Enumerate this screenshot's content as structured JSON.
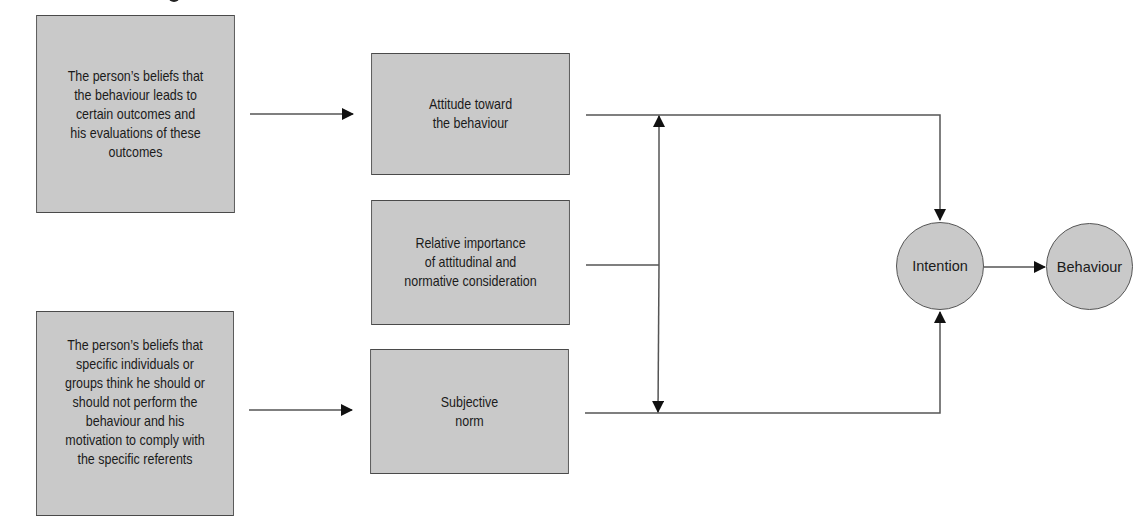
{
  "diagram": {
    "nodes": {
      "beliefs_outcomes": "The person’s beliefs that\nthe behaviour leads to\ncertain outcomes and\nhis evaluations of  these\noutcomes",
      "attitude": "Attitude toward\nthe behaviour",
      "relative_importance": "Relative importance\nof attitudinal and\nnormative consideration",
      "beliefs_referents": "The person’s beliefs that\nspecific individuals or\ngroups think he should or\nshould not perform the\nbehaviour and his\nmotivation to comply with\nthe specific referents",
      "subjective_norm": "Subjective\nnorm",
      "intention": "Intention",
      "behaviour": "Behaviour"
    },
    "edges": [
      {
        "from": "beliefs_outcomes",
        "to": "attitude"
      },
      {
        "from": "beliefs_referents",
        "to": "subjective_norm"
      },
      {
        "from": "attitude",
        "to": "intention"
      },
      {
        "from": "subjective_norm",
        "to": "intention"
      },
      {
        "from": "relative_importance",
        "to": "attitude-subjective_norm link (bidirectional)"
      },
      {
        "from": "intention",
        "to": "behaviour"
      }
    ],
    "colors": {
      "box_fill": "#c9c9c9",
      "border": "#4a4a4a",
      "line": "#555555",
      "arrowhead": "#111111"
    }
  }
}
